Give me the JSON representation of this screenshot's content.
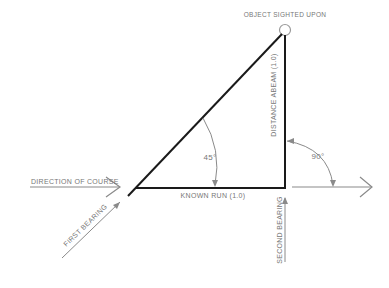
{
  "diagram": {
    "labels": {
      "object": "OBJECT SIGHTED UPON",
      "distance_abeam": "DISTANCE ABEAM   (1.0)",
      "known_run": "KNOWN RUN   (1.0)",
      "direction_of_course": "DIRECTION OF COURSE",
      "first_bearing": "FIRST BEARING",
      "second_bearing": "SECOND BEARING",
      "angle_first": "45°",
      "angle_second": "90°"
    },
    "colors": {
      "main_line": "#1a1a1a",
      "arrow_line": "#8a8a8a",
      "text": "#777777"
    }
  }
}
